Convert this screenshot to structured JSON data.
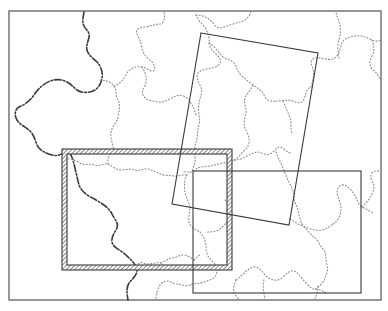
{
  "map": {
    "frame": {
      "x": 9,
      "y": 11,
      "w": 372,
      "h": 289,
      "stroke": "#6b6b6b"
    },
    "colors": {
      "coast": "#3a3a3a",
      "border": "#8a8a8a",
      "footprint": "#3a3a3a",
      "background": "#ffffff"
    },
    "footprints": [
      {
        "name": "rotated-footprint",
        "corners": [
          [
            201,
            33
          ],
          [
            318,
            53
          ],
          [
            289,
            225
          ],
          [
            172,
            204
          ]
        ]
      },
      {
        "name": "right-footprint",
        "x": 193,
        "y": 171,
        "w": 168,
        "h": 122
      },
      {
        "name": "hatched-footprint",
        "x": 62,
        "y": 149,
        "w": 170,
        "h": 121,
        "band": 5
      }
    ]
  }
}
